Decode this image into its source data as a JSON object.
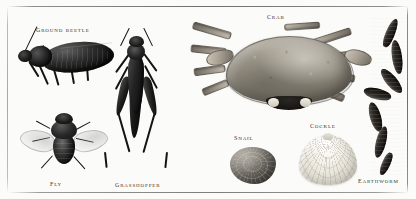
{
  "plate": {
    "kind": "natural-history-specimen-plate",
    "background_color": "#fbfbf9",
    "frame_rule_color": "#7d7a75",
    "caption_color": "#55534e"
  },
  "specimens": [
    {
      "id": "ground-beetle",
      "label": "Ground beetle",
      "group": "insect",
      "caption_x": 36,
      "caption_y": 25,
      "tone": "black"
    },
    {
      "id": "fly",
      "label": "Fly",
      "group": "insect",
      "caption_x": 50,
      "caption_y": 179,
      "tone": "black"
    },
    {
      "id": "grasshopper",
      "label": "Grasshopper",
      "group": "insect",
      "caption_x": 115,
      "caption_y": 180,
      "tone": "black"
    },
    {
      "id": "crab",
      "label": "Crab",
      "group": "crustacean",
      "caption_x": 267,
      "caption_y": 12,
      "tone": "grey-buff"
    },
    {
      "id": "snail",
      "label": "Snail",
      "group": "mollusc",
      "caption_x": 234,
      "caption_y": 133,
      "tone": "grey"
    },
    {
      "id": "cockle",
      "label": "Cockle",
      "group": "mollusc",
      "caption_x": 310,
      "caption_y": 121,
      "tone": "white"
    },
    {
      "id": "earthworm",
      "label": "Earthworm",
      "group": "annelid",
      "caption_x": 358,
      "caption_y": 176,
      "tone": "black"
    }
  ]
}
